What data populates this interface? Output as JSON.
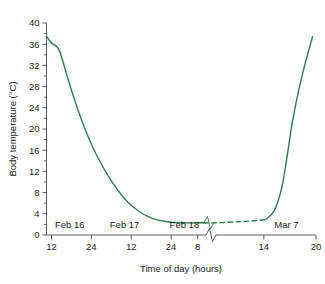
{
  "chart_data": {
    "type": "line",
    "title": "",
    "xlabel": "Time of day (hours)",
    "ylabel": "Body temperature (°C)",
    "ylim": [
      0,
      40
    ],
    "y_ticks": [
      0,
      4,
      8,
      12,
      16,
      20,
      24,
      28,
      32,
      36,
      40
    ],
    "y_minor_step": 2,
    "grid": false,
    "legend": "none",
    "line_color": "#2e7d52",
    "axis_color": "#4a4a4a",
    "axis_break": {
      "present": true,
      "style": "zigzag",
      "note": "x-axis compressed between Feb 18 and Mar 7"
    },
    "x_ticks": [
      {
        "label": "12",
        "segment": "left",
        "hour": 12
      },
      {
        "label": "24",
        "segment": "left",
        "hour": 24
      },
      {
        "label": "12",
        "segment": "left",
        "hour": 36
      },
      {
        "label": "24",
        "segment": "left",
        "hour": 48
      },
      {
        "label": "8",
        "segment": "left",
        "hour": 56
      },
      {
        "label": "14",
        "segment": "right",
        "hour": 14
      },
      {
        "label": "20",
        "segment": "right",
        "hour": 20
      }
    ],
    "date_labels": [
      "Feb 16",
      "Feb 17",
      "Feb 18",
      "Mar 7"
    ],
    "series": [
      {
        "name": "Body temperature",
        "style": "solid-then-dashed",
        "points_before_break": [
          {
            "hour": 10.5,
            "temp": 37.5
          },
          {
            "hour": 11.5,
            "temp": 36.6
          },
          {
            "hour": 12.5,
            "temp": 36.0
          },
          {
            "hour": 13.5,
            "temp": 35.6
          },
          {
            "hour": 14.5,
            "temp": 34.6
          },
          {
            "hour": 15.5,
            "temp": 32.6
          },
          {
            "hour": 17.0,
            "temp": 29.4
          },
          {
            "hour": 19.0,
            "temp": 25.4
          },
          {
            "hour": 21.0,
            "temp": 21.8
          },
          {
            "hour": 23.0,
            "temp": 18.6
          },
          {
            "hour": 25.0,
            "temp": 15.8
          },
          {
            "hour": 27.0,
            "temp": 13.4
          },
          {
            "hour": 29.0,
            "temp": 11.2
          },
          {
            "hour": 31.0,
            "temp": 9.3
          },
          {
            "hour": 33.0,
            "temp": 7.6
          },
          {
            "hour": 35.0,
            "temp": 6.2
          },
          {
            "hour": 37.0,
            "temp": 5.1
          },
          {
            "hour": 39.0,
            "temp": 4.2
          },
          {
            "hour": 41.0,
            "temp": 3.5
          },
          {
            "hour": 43.0,
            "temp": 3.0
          },
          {
            "hour": 45.0,
            "temp": 2.7
          },
          {
            "hour": 48.0,
            "temp": 2.4
          },
          {
            "hour": 52.0,
            "temp": 2.3
          },
          {
            "hour": 56.0,
            "temp": 2.3
          },
          {
            "hour": 58.5,
            "temp": 2.3
          }
        ],
        "points_dashed_after_break": [
          {
            "hour": 8.5,
            "temp": 2.3
          },
          {
            "hour": 11.0,
            "temp": 2.5
          },
          {
            "hour": 13.0,
            "temp": 2.7
          },
          {
            "hour": 14.2,
            "temp": 2.9
          }
        ],
        "points_after_break": [
          {
            "hour": 14.2,
            "temp": 2.9
          },
          {
            "hour": 15.2,
            "temp": 4.6
          },
          {
            "hour": 16.0,
            "temp": 8.5
          },
          {
            "hour": 16.6,
            "temp": 14.0
          },
          {
            "hour": 17.2,
            "temp": 20.5
          },
          {
            "hour": 17.9,
            "temp": 26.5
          },
          {
            "hour": 18.7,
            "temp": 32.0
          },
          {
            "hour": 19.6,
            "temp": 37.4
          }
        ]
      }
    ]
  }
}
